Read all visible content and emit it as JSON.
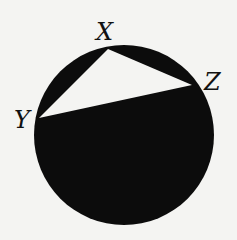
{
  "diagram": {
    "type": "inscribed-triangle-in-circle",
    "colors": {
      "background": "#f4f4f2",
      "fill": "#0c0c0c",
      "triangle": "#f4f4f2",
      "text": "#111111"
    },
    "circle": {
      "cx": 124,
      "cy": 135,
      "r": 90
    },
    "points": {
      "X": {
        "label": "X",
        "x": 108,
        "y": 49,
        "label_x": 96,
        "label_y": 40
      },
      "Y": {
        "label": "Y",
        "x": 39,
        "y": 118,
        "label_x": 14,
        "label_y": 128
      },
      "Z": {
        "label": "Z",
        "x": 192,
        "y": 85,
        "label_x": 204,
        "label_y": 90
      }
    }
  }
}
